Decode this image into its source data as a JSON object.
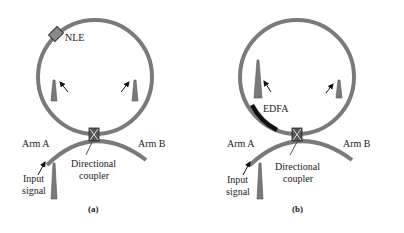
{
  "colors": {
    "fiber": "#7a7a7a",
    "pulse": "#7a7a7a",
    "edfa": "#111111",
    "text": "#222222",
    "coupler_fill": "#555555"
  },
  "panels": [
    {
      "caption": "(a)",
      "element_label": "NLE",
      "arm_a": "Arm  A",
      "arm_b": "Arm  B",
      "input_line1": "Input",
      "input_line2": "signal",
      "coupler_line1": "Directional",
      "coupler_line2": "coupler"
    },
    {
      "caption": "(b)",
      "element_label": "EDFA",
      "arm_a": "Arm  A",
      "arm_b": "Arm  B",
      "input_line1": "Input",
      "input_line2": "signal",
      "coupler_line1": "Directional",
      "coupler_line2": "coupler"
    }
  ]
}
